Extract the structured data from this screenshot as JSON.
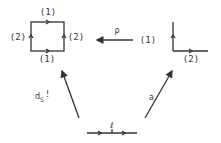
{
  "diagram": {
    "square": {
      "top_label": "(1)",
      "left_label": "(2)",
      "right_label": "(2)",
      "bottom_label": "(1)"
    },
    "map_arrow": {
      "label": "ρ"
    },
    "corner": {
      "vertical_label": "(1)",
      "horizontal_label": "(2)"
    },
    "left_arrow": {
      "label_main": "d",
      "label_sub": "S",
      "label_suffix": "!"
    },
    "right_arrow": {
      "label": "a"
    },
    "base": {
      "label": "ℓ"
    },
    "colors": {
      "ink": "#333333",
      "background": "#ffffff"
    }
  }
}
